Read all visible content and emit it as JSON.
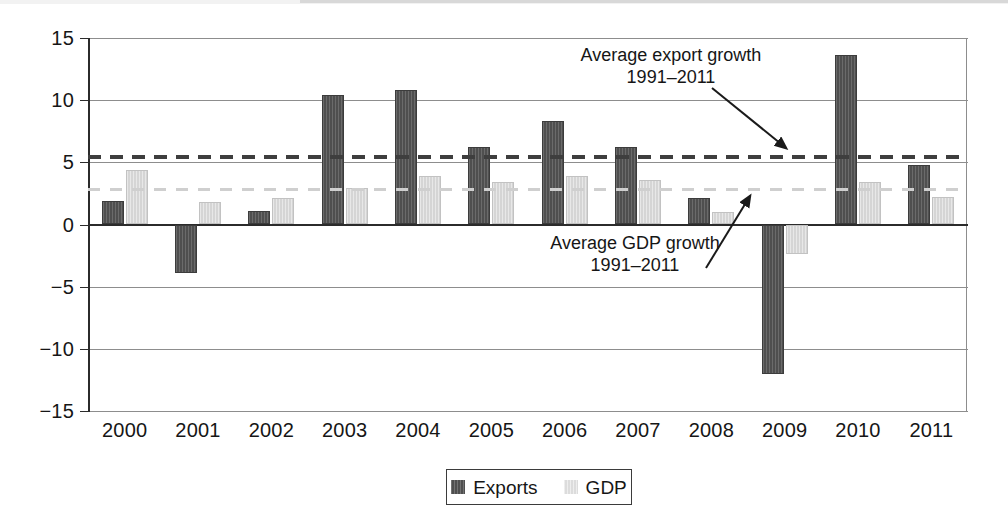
{
  "chart_data": {
    "type": "bar",
    "title": "",
    "subtitle": "",
    "xlabel": "",
    "ylabel": "",
    "categories": [
      "2000",
      "2001",
      "2002",
      "2003",
      "2004",
      "2005",
      "2006",
      "2007",
      "2008",
      "2009",
      "2010",
      "2011"
    ],
    "series": [
      {
        "name": "Exports",
        "color": "#4f4f4f",
        "values": [
          1.9,
          -3.9,
          1.1,
          10.4,
          10.8,
          6.2,
          8.3,
          6.2,
          2.1,
          -12.0,
          13.6,
          4.8
        ]
      },
      {
        "name": "GDP",
        "color": "#d5d5d5",
        "values": [
          4.4,
          1.8,
          2.1,
          2.9,
          3.9,
          3.4,
          3.9,
          3.6,
          1.0,
          -2.4,
          3.4,
          2.2
        ]
      }
    ],
    "reference_lines": [
      {
        "id": "avg-export",
        "label": "Average export growth",
        "label_line2": "1991–2011",
        "value": 5.4,
        "style": "dashed",
        "color": "#3e3e3e"
      },
      {
        "id": "avg-gdp",
        "label": "Average GDP growth",
        "label_line2": "1991–2011",
        "value": 2.8,
        "style": "dashed",
        "color": "#cfcfcf"
      }
    ],
    "ylim": [
      -15,
      15
    ],
    "yticks": [
      15,
      10,
      5,
      0,
      -5,
      -10,
      -15
    ],
    "ytick_labels": [
      "15",
      "10",
      "5",
      "0",
      "−5",
      "−10",
      "−15"
    ],
    "grid": true,
    "legend_position": "bottom-center",
    "legend_entries": [
      "Exports",
      "GDP"
    ]
  },
  "annotations": {
    "export": {
      "line1": "Average export growth",
      "line2": "1991–2011"
    },
    "gdp": {
      "line1": "Average GDP growth",
      "line2": "1991–2011"
    }
  },
  "legend": {
    "exports_label": "Exports",
    "gdp_label": "GDP"
  }
}
